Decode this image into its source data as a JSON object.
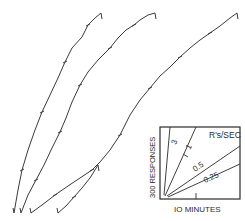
{
  "chart_data": {
    "type": "line",
    "title": "",
    "series": [
      {
        "name": "record-1",
        "points": [
          [
            14,
            213
          ],
          [
            18,
            190
          ],
          [
            22,
            170
          ],
          [
            28,
            150
          ],
          [
            35,
            130
          ],
          [
            42,
            112
          ],
          [
            50,
            95
          ],
          [
            58,
            78
          ],
          [
            65,
            62
          ],
          [
            72,
            48
          ],
          [
            82,
            37
          ],
          [
            88,
            25
          ],
          [
            95,
            18
          ],
          [
            101,
            13
          ]
        ]
      },
      {
        "name": "record-2",
        "points": [
          [
            21,
            213
          ],
          [
            28,
            195
          ],
          [
            36,
            180
          ],
          [
            44,
            165
          ],
          [
            52,
            148
          ],
          [
            60,
            132
          ],
          [
            66,
            118
          ],
          [
            72,
            102
          ],
          [
            80,
            85
          ],
          [
            88,
            72
          ],
          [
            98,
            60
          ],
          [
            110,
            48
          ],
          [
            118,
            38
          ],
          [
            126,
            30
          ],
          [
            134,
            25
          ],
          [
            140,
            20
          ],
          [
            148,
            15
          ],
          [
            155,
            13
          ]
        ]
      },
      {
        "name": "record-3",
        "points": [
          [
            31,
            213
          ],
          [
            42,
            205
          ],
          [
            55,
            195
          ],
          [
            68,
            186
          ],
          [
            80,
            178
          ],
          [
            92,
            170
          ],
          [
            100,
            162
          ],
          [
            110,
            150
          ],
          [
            120,
            135
          ],
          [
            130,
            115
          ],
          [
            140,
            100
          ],
          [
            150,
            88
          ],
          [
            160,
            76
          ],
          [
            170,
            67
          ],
          [
            180,
            57
          ],
          [
            190,
            48
          ],
          [
            200,
            40
          ],
          [
            210,
            33
          ],
          [
            220,
            26
          ],
          [
            230,
            18
          ],
          [
            237,
            13
          ]
        ]
      },
      {
        "name": "record-4",
        "points": [
          [
            58,
            213
          ],
          [
            66,
            206
          ],
          [
            74,
            197
          ],
          [
            82,
            188
          ],
          [
            90,
            178
          ],
          [
            98,
            165
          ]
        ]
      }
    ],
    "legend": {
      "title": "R's/SEC",
      "ylabel": "300 RESPONSES",
      "xlabel": "10 MINUTES",
      "rates": [
        "3",
        "1",
        "0.5",
        "0.25"
      ]
    },
    "grid": false
  },
  "legend_box": {
    "rate_title": "R's/SEC",
    "y_label": "300 RESPONSES",
    "x_label": "IO MINUTES",
    "rate_3": "3",
    "rate_1": "1",
    "rate_05": "0.5",
    "rate_025": "0.25"
  },
  "colors": {
    "ink": "#3a3a3a",
    "background": "#ffffff"
  }
}
